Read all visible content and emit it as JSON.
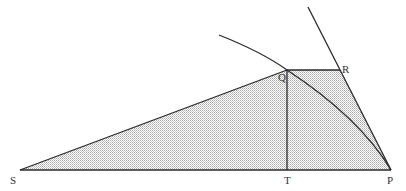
{
  "diagram": {
    "type": "geometry",
    "points": {
      "S": {
        "label": "S",
        "x": 20,
        "y": 170
      },
      "T": {
        "label": "T",
        "x": 287,
        "y": 170
      },
      "P": {
        "label": "P",
        "x": 391,
        "y": 170
      },
      "Q": {
        "label": "Q",
        "x": 287,
        "y": 70
      },
      "R": {
        "label": "R",
        "x": 340,
        "y": 70
      }
    },
    "labels": {
      "S": "S",
      "T": "T",
      "P": "P",
      "Q": "Q",
      "R": "R"
    },
    "colors": {
      "stroke": "#2a2a2a",
      "shade": "#b8b8b8",
      "label": "#333333"
    }
  }
}
